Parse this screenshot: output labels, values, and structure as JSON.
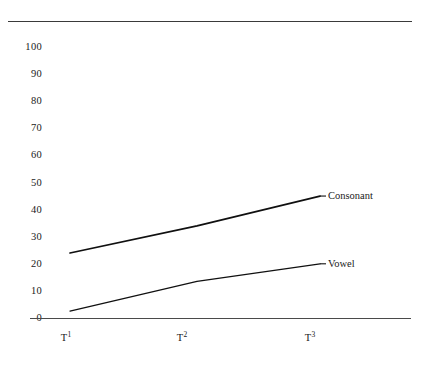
{
  "chart_data": {
    "type": "line",
    "title": "",
    "subtitle": "",
    "xlabel": "",
    "ylabel": "",
    "x": [
      "T1",
      "T2",
      "T3"
    ],
    "xtick_labels": [
      {
        "base": "T",
        "sup": "1"
      },
      {
        "base": "T",
        "sup": "2"
      },
      {
        "base": "T",
        "sup": "3"
      }
    ],
    "ytick_labels": [
      "100",
      "90",
      "80",
      "70",
      "60",
      "50",
      "40",
      "30",
      "20",
      "10",
      "0"
    ],
    "yticks": [
      100,
      90,
      80,
      70,
      60,
      50,
      40,
      30,
      20,
      10,
      0
    ],
    "ylim": [
      0,
      100
    ],
    "grid": false,
    "legend": "inline-end-labels",
    "series": [
      {
        "name": "Consonant",
        "label": "Consonant",
        "values": [
          24,
          34,
          45
        ],
        "color": "#101010"
      },
      {
        "name": "Vowel",
        "label": "Vowel",
        "values": [
          2.5,
          13.5,
          20
        ],
        "color": "#101010"
      }
    ],
    "annotations": [
      {
        "text": "Consonant",
        "attached_to": "Consonant",
        "position": "right-of-last-point"
      },
      {
        "text": "Vowel",
        "attached_to": "Vowel",
        "position": "right-of-last-point"
      }
    ],
    "axis_lines": {
      "top_rule": true,
      "bottom_axis": true,
      "left_axis": false,
      "right_axis": false
    },
    "colors": {
      "line": "#101010",
      "axis": "#4a4a4a",
      "text": "#1a1a1a",
      "background": "#ffffff"
    }
  }
}
